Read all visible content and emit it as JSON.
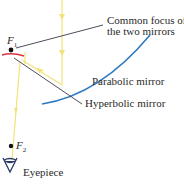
{
  "diagram": {
    "labels": {
      "common_focus_line1": "Common focus of",
      "common_focus_line2": "the two mirrors",
      "parabolic_mirror": "Parabolic mirror",
      "hyperbolic_mirror": "Hyperbolic mirror",
      "eyepiece": "Eyepiece"
    },
    "foci": {
      "f1": {
        "symbol": "F",
        "sub": "1"
      },
      "f2": {
        "symbol": "F",
        "sub": "2"
      }
    },
    "colors": {
      "ray": "#f2e27a",
      "parabolic": "#2f7ac0",
      "hyperbolic": "#d93340",
      "leader_line": "#3a3a4a",
      "point": "#111111",
      "eyepiece": "#2a3a66"
    },
    "icons": [
      "focus-point",
      "eyepiece-icon",
      "ray-arrow"
    ]
  }
}
